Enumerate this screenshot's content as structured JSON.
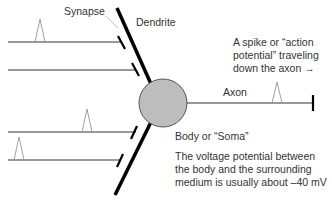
{
  "labels": {
    "synapse": "Synapse",
    "dendrite": "Dendrite",
    "axon": "Axon",
    "soma": "Body or “Soma”",
    "spike_caption_line1": "A spike or “action",
    "spike_caption_line2": "potential” traveling",
    "spike_caption_line3": "down the axon →",
    "voltage_line1": "The voltage potential between",
    "voltage_line2": "the body and the surrounding",
    "voltage_line3": "medium is usually about –40 mV"
  },
  "colors": {
    "soma_fill": "#bdbdbd",
    "soma_stroke": "#555555",
    "line": "#333333",
    "dendrite": "#000000",
    "spike": "#888888"
  }
}
